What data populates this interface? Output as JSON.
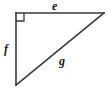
{
  "figure": {
    "name": "right-triangle-diagram",
    "background_color": "#ffffff",
    "stroke_color": "#3a3a3a",
    "label_color": "#1a1a1a",
    "width": 107,
    "height": 97
  },
  "labels": {
    "top_side": "e",
    "left_side": "f",
    "hypotenuse": "g"
  },
  "geometry": {
    "vertices": {
      "top_left": [
        16,
        13
      ],
      "top_right": [
        104,
        13
      ],
      "bottom_left": [
        16,
        85
      ]
    },
    "right_angle_vertex": "top_left",
    "right_angle_marker_size": 8,
    "sides": [
      {
        "name": "top",
        "label": "e",
        "from": "top_left",
        "to": "top_right"
      },
      {
        "name": "left",
        "label": "f",
        "from": "top_left",
        "to": "bottom_left"
      },
      {
        "name": "hypotenuse",
        "label": "g",
        "from": "bottom_left",
        "to": "top_right"
      }
    ]
  }
}
